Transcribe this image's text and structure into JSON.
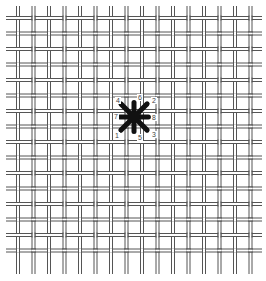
{
  "diagram": {
    "type": "needlepoint-canvas-stitch",
    "colors": {
      "background": "#ffffff",
      "thread": "#555555",
      "stitch": "#111111",
      "label": "#444444"
    },
    "grid": {
      "origin_x": 18,
      "origin_y": 18,
      "spacing": 15.5,
      "columns": 16,
      "rows": 16,
      "thread_gap": 3
    },
    "stitch": {
      "name": "star stitch",
      "center_x": 134,
      "center_y": 117,
      "radius": 16,
      "labels": [
        {
          "text": "1",
          "position": "bottom-left",
          "x": 114,
          "y": 132
        },
        {
          "text": "2",
          "position": "top-right",
          "x": 151,
          "y": 97
        },
        {
          "text": "3",
          "position": "bottom-right",
          "x": 151,
          "y": 131
        },
        {
          "text": "4",
          "position": "top-left",
          "x": 115,
          "y": 97
        },
        {
          "text": "5",
          "position": "bottom",
          "x": 137,
          "y": 134
        },
        {
          "text": "6",
          "position": "top",
          "x": 137,
          "y": 94
        },
        {
          "text": "7",
          "position": "left",
          "x": 113,
          "y": 113
        },
        {
          "text": "8",
          "position": "right",
          "x": 151,
          "y": 114
        }
      ]
    }
  }
}
